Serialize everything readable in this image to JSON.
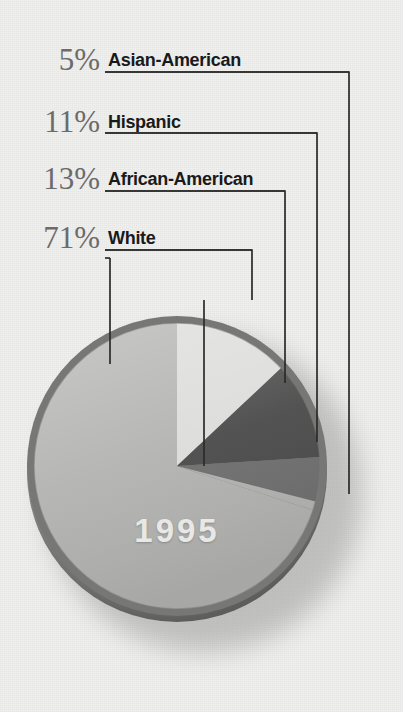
{
  "chart_data": {
    "type": "pie",
    "title": "1995",
    "center_label": "1995",
    "categories": [
      "White",
      "African-American",
      "Hispanic",
      "Asian-American"
    ],
    "values": [
      71,
      13,
      11,
      5
    ],
    "unit": "%",
    "legend_position": "top-left",
    "grid": false,
    "slices": [
      {
        "label": "White",
        "value": 71,
        "display": "71%",
        "color": "#b2b2b0"
      },
      {
        "label": "African-American",
        "value": 13,
        "display": "13%",
        "color": "#dcdcda"
      },
      {
        "label": "Hispanic",
        "value": 11,
        "display": "11%",
        "color": "#4a4a4a"
      },
      {
        "label": "Asian-American",
        "value": 5,
        "display": "5%",
        "color": "#6e6e6e"
      }
    ]
  },
  "legend": {
    "rows": [
      {
        "percent": "5%",
        "label": "Asian-American"
      },
      {
        "percent": "11%",
        "label": "Hispanic"
      },
      {
        "percent": "13%",
        "label": "African-American"
      },
      {
        "percent": "71%",
        "label": "White"
      }
    ]
  },
  "colors": {
    "background": "#f1f1ef",
    "text_percent": "#6b6b6b",
    "text_label": "#1a1a1a",
    "leader_line": "#2b2b2b",
    "slice_white": "#b2b2b0",
    "slice_african_american": "#dcdcda",
    "slice_hispanic": "#4a4a4a",
    "slice_asian_american": "#6e6e6e",
    "pie_rim": "#6f6f6d",
    "year_text": "#e8e8e6"
  }
}
